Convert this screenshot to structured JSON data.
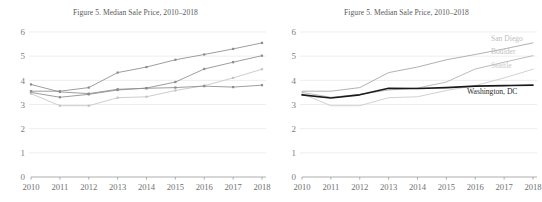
{
  "figure": {
    "panels": [
      {
        "id": "left-panel",
        "title": "Figure 5. Median Sale Price, 2010–2018",
        "labels_shown": false
      },
      {
        "id": "right-panel",
        "title": "Figure 5. Median Sale Price, 2010–2018",
        "labels_shown": true
      }
    ]
  },
  "chart_data": [
    {
      "type": "line",
      "title": "Figure 5. Median Sale Price, 2010–2018",
      "xlabel": "",
      "ylabel": "",
      "categories": [
        "2010",
        "2011",
        "2012",
        "2013",
        "2014",
        "2015",
        "2016",
        "2017",
        "2018"
      ],
      "x": [
        2010,
        2011,
        2012,
        2013,
        2014,
        2015,
        2016,
        2017,
        2018
      ],
      "ylim": [
        0,
        6
      ],
      "yticks": [
        0,
        1,
        2,
        3,
        4,
        5,
        6
      ],
      "grid": true,
      "legend": "none",
      "markers": true,
      "series": [
        {
          "name": "San Diego",
          "color": "#8c8c8c",
          "values": [
            3.55,
            3.55,
            3.7,
            4.32,
            4.55,
            4.85,
            5.07,
            5.3,
            5.55
          ]
        },
        {
          "name": "Boulder",
          "color": "#8c8c8c",
          "values": [
            3.5,
            3.3,
            3.42,
            3.6,
            3.68,
            3.93,
            4.47,
            4.75,
            5.02
          ]
        },
        {
          "name": "Seattle",
          "color": "#c4c4c4",
          "values": [
            3.45,
            2.95,
            2.95,
            3.28,
            3.32,
            3.58,
            3.78,
            4.1,
            4.46
          ]
        },
        {
          "name": "Washington, DC",
          "color": "#8c8c8c",
          "values": [
            3.83,
            3.52,
            3.45,
            3.63,
            3.67,
            3.7,
            3.76,
            3.72,
            3.8
          ]
        }
      ]
    },
    {
      "type": "line",
      "title": "Figure 5. Median Sale Price, 2010–2018",
      "xlabel": "",
      "ylabel": "",
      "categories": [
        "2010",
        "2011",
        "2012",
        "2013",
        "2014",
        "2015",
        "2016",
        "2017",
        "2018"
      ],
      "x": [
        2010,
        2011,
        2012,
        2013,
        2014,
        2015,
        2016,
        2017,
        2018
      ],
      "ylim": [
        0,
        6
      ],
      "yticks": [
        0,
        1,
        2,
        3,
        4,
        5,
        6
      ],
      "grid": true,
      "legend": "inline-end-labels",
      "markers": false,
      "annotations": [
        {
          "text": "San Diego",
          "value": 5.55,
          "color": "#c0c0c0"
        },
        {
          "text": "Boulder",
          "value": 5.02,
          "color": "#c0c0c0"
        },
        {
          "text": "Seattle",
          "value": 4.46,
          "color": "#c8c8c8"
        },
        {
          "text": "Washington, DC",
          "value": 3.8,
          "color": "#2b2b2b"
        }
      ],
      "series": [
        {
          "name": "San Diego",
          "color": "#a8a8a8",
          "values": [
            3.55,
            3.55,
            3.7,
            4.32,
            4.55,
            4.85,
            5.07,
            5.3,
            5.55
          ]
        },
        {
          "name": "Boulder",
          "color": "#b4b4b4",
          "values": [
            3.5,
            3.3,
            3.42,
            3.6,
            3.68,
            3.93,
            4.47,
            4.75,
            5.02
          ]
        },
        {
          "name": "Seattle",
          "color": "#cccccc",
          "values": [
            3.45,
            2.95,
            2.95,
            3.28,
            3.32,
            3.58,
            3.78,
            4.1,
            4.46
          ]
        },
        {
          "name": "Washington, DC",
          "color": "#1a1a1a",
          "values": [
            3.4,
            3.27,
            3.4,
            3.67,
            3.66,
            3.7,
            3.76,
            3.78,
            3.8
          ]
        }
      ]
    }
  ],
  "axes": {
    "ytick_labels": [
      "6",
      "5",
      "4",
      "3",
      "2",
      "1",
      "0"
    ],
    "xtick_labels": [
      "2010",
      "2011",
      "2012",
      "2013",
      "2014",
      "2015",
      "2016",
      "2017",
      "2018"
    ]
  }
}
